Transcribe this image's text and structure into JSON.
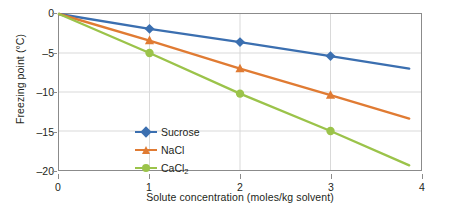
{
  "chart_data": {
    "type": "line",
    "title": "",
    "xlabel": "Solute concentration (moles/kg solvent)",
    "ylabel": "Freezing point (°C)",
    "xlim": [
      0,
      4
    ],
    "ylim": [
      -20,
      0
    ],
    "xticks": [
      "0",
      "1",
      "2",
      "3",
      "4"
    ],
    "xtick_values": [
      0,
      1,
      2,
      3,
      4
    ],
    "yticks": [
      "0",
      "–5",
      "–10",
      "–15",
      "–20"
    ],
    "ytick_values": [
      0,
      -5,
      -10,
      -15,
      -20
    ],
    "grid": true,
    "legend_position": "inside lower-left",
    "series": [
      {
        "name": "Sucrose",
        "color": "#3b6fb0",
        "marker": "diamond",
        "x": [
          0,
          1,
          2,
          3,
          3.87
        ],
        "values": [
          0,
          -1.9,
          -3.6,
          -5.4,
          -7.0
        ],
        "marker_x": [
          1,
          2,
          3
        ]
      },
      {
        "name": "NaCl",
        "color": "#e07b33",
        "marker": "triangle",
        "x": [
          0,
          1,
          2,
          3,
          3.87
        ],
        "values": [
          0,
          -3.4,
          -7.0,
          -10.4,
          -13.4
        ],
        "marker_x": [
          1,
          2,
          3
        ]
      },
      {
        "name": "CaCl2",
        "color": "#9bc34a",
        "marker": "circle",
        "x": [
          0,
          1,
          2,
          3,
          3.87
        ],
        "values": [
          0,
          -5.0,
          -10.2,
          -15.0,
          -19.4
        ],
        "marker_x": [
          1,
          2,
          3
        ]
      }
    ]
  },
  "legend": {
    "items": [
      {
        "label": "Sucrose",
        "sub": ""
      },
      {
        "label": "NaCl",
        "sub": ""
      },
      {
        "label": "CaCl",
        "sub": "2"
      }
    ]
  },
  "axes": {
    "x_title": "Solute concentration (moles/kg solvent)",
    "y_title": "Freezing point (°C)",
    "x_tick_labels": [
      "0",
      "1",
      "2",
      "3",
      "4"
    ],
    "y_tick_labels": [
      "0",
      "–5",
      "–10",
      "–15",
      "–20"
    ]
  },
  "colors": {
    "sucrose": "#3b6fb0",
    "nacl": "#e07b33",
    "cacl2": "#9bc34a",
    "grid": "#d9d9d9",
    "frame": "#8b8b8b",
    "text": "#231f20",
    "background": "#ffffff"
  }
}
